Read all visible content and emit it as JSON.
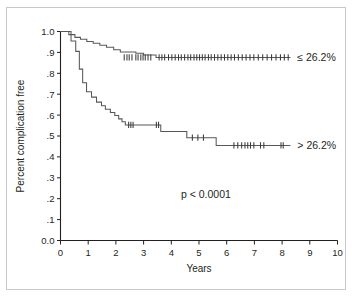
{
  "chart_data": {
    "type": "line",
    "subtype": "kaplan-meier-step",
    "title": "",
    "xlabel": "Years",
    "ylabel": "Percent complication free",
    "xlim": [
      0,
      10
    ],
    "ylim": [
      0.0,
      1.0
    ],
    "grid": false,
    "legend_position": "inline-right",
    "x_ticks": [
      "0",
      "1",
      "2",
      "3",
      "4",
      "5",
      "6",
      "7",
      "8",
      "9",
      "10"
    ],
    "x_tick_values": [
      0,
      1,
      2,
      3,
      4,
      5,
      6,
      7,
      8,
      9,
      10
    ],
    "y_ticks": [
      "0.0",
      ".1",
      ".2",
      ".3",
      ".4",
      ".5",
      ".6",
      ".7",
      ".8",
      ".9",
      "1.0"
    ],
    "y_tick_values": [
      0.0,
      0.1,
      0.2,
      0.3,
      0.4,
      0.5,
      0.6,
      0.7,
      0.8,
      0.9,
      1.0
    ],
    "annotations": [
      {
        "name": "p-value",
        "text": "p < 0.0001",
        "x": 5.25,
        "y": 0.205
      }
    ],
    "series": [
      {
        "name": "low-group",
        "label": "≤ 26.2%",
        "label_x": 8.55,
        "label_y": 0.876,
        "color": "#58585b",
        "steps": [
          [
            0.0,
            1.0
          ],
          [
            0.3,
            1.0
          ],
          [
            0.3,
            0.985
          ],
          [
            0.52,
            0.985
          ],
          [
            0.52,
            0.972
          ],
          [
            0.72,
            0.972
          ],
          [
            0.72,
            0.963
          ],
          [
            0.95,
            0.963
          ],
          [
            0.95,
            0.952
          ],
          [
            1.18,
            0.952
          ],
          [
            1.18,
            0.944
          ],
          [
            1.42,
            0.944
          ],
          [
            1.42,
            0.934
          ],
          [
            1.66,
            0.934
          ],
          [
            1.66,
            0.925
          ],
          [
            1.92,
            0.925
          ],
          [
            1.92,
            0.913
          ],
          [
            2.16,
            0.913
          ],
          [
            2.16,
            0.902
          ],
          [
            2.72,
            0.902
          ],
          [
            2.72,
            0.896
          ],
          [
            3.0,
            0.896
          ],
          [
            3.0,
            0.888
          ],
          [
            3.45,
            0.888
          ],
          [
            3.45,
            0.876
          ],
          [
            8.3,
            0.876
          ]
        ],
        "censor_x": [
          2.3,
          2.4,
          2.48,
          2.58,
          2.72,
          2.8,
          2.9,
          2.98,
          3.06,
          3.16,
          3.26,
          3.56,
          3.66,
          3.76,
          3.9,
          4.02,
          4.14,
          4.26,
          4.36,
          4.48,
          4.6,
          4.7,
          4.82,
          4.92,
          5.02,
          5.12,
          5.22,
          5.34,
          5.44,
          5.56,
          5.68,
          5.8,
          5.92,
          6.04,
          6.16,
          6.28,
          6.42,
          6.56,
          6.7,
          6.84,
          6.98,
          7.14,
          7.3,
          7.46,
          7.62,
          7.78,
          7.94,
          8.08,
          8.22
        ],
        "censor_y": 0.876
      },
      {
        "name": "high-group",
        "label": "> 26.2%",
        "label_x": 8.55,
        "label_y": 0.455,
        "color": "#58585b",
        "steps": [
          [
            0.0,
            1.0
          ],
          [
            0.38,
            1.0
          ],
          [
            0.38,
            0.955
          ],
          [
            0.55,
            0.955
          ],
          [
            0.55,
            0.905
          ],
          [
            0.68,
            0.905
          ],
          [
            0.68,
            0.82
          ],
          [
            0.8,
            0.82
          ],
          [
            0.8,
            0.755
          ],
          [
            0.94,
            0.755
          ],
          [
            0.94,
            0.712
          ],
          [
            1.12,
            0.712
          ],
          [
            1.12,
            0.686
          ],
          [
            1.3,
            0.686
          ],
          [
            1.3,
            0.662
          ],
          [
            1.48,
            0.662
          ],
          [
            1.48,
            0.645
          ],
          [
            1.62,
            0.645
          ],
          [
            1.62,
            0.628
          ],
          [
            1.8,
            0.628
          ],
          [
            1.8,
            0.612
          ],
          [
            1.96,
            0.612
          ],
          [
            1.96,
            0.598
          ],
          [
            2.1,
            0.598
          ],
          [
            2.1,
            0.582
          ],
          [
            2.22,
            0.582
          ],
          [
            2.22,
            0.568
          ],
          [
            2.34,
            0.568
          ],
          [
            2.34,
            0.553
          ],
          [
            3.62,
            0.553
          ],
          [
            3.62,
            0.522
          ],
          [
            4.56,
            0.522
          ],
          [
            4.56,
            0.492
          ],
          [
            5.62,
            0.492
          ],
          [
            5.62,
            0.455
          ],
          [
            8.3,
            0.455
          ]
        ],
        "censor_x": [
          2.46,
          2.54,
          2.62,
          3.46,
          3.54,
          4.76,
          4.96,
          5.16,
          6.26,
          6.4,
          6.54,
          6.66,
          6.76,
          6.86,
          6.98,
          7.22,
          7.34,
          7.96,
          8.04
        ],
        "censor_y_map": {
          "2.46": 0.553,
          "2.54": 0.553,
          "2.62": 0.553,
          "3.46": 0.553,
          "3.54": 0.553,
          "4.76": 0.492,
          "4.96": 0.492,
          "5.16": 0.492,
          "6.26": 0.455,
          "6.40": 0.455,
          "6.54": 0.455,
          "6.66": 0.455,
          "6.76": 0.455,
          "6.86": 0.455,
          "6.98": 0.455,
          "7.22": 0.455,
          "7.34": 0.455,
          "7.96": 0.455,
          "8.04": 0.455
        }
      }
    ]
  }
}
